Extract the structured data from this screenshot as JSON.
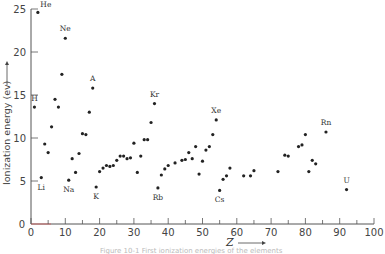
{
  "chart_data": {
    "type": "scatter",
    "title": "",
    "xlabel": "Z",
    "ylabel": "Ionization energy (ev)",
    "xlim": [
      0,
      100
    ],
    "ylim": [
      0,
      25
    ],
    "x_ticks": [
      0,
      10,
      20,
      30,
      40,
      50,
      60,
      70,
      80,
      90,
      100
    ],
    "y_ticks": [
      0,
      5,
      10,
      15,
      20,
      25
    ],
    "grid": false,
    "legend": null,
    "points": [
      {
        "z": 1,
        "ie": 13.6,
        "label": "H"
      },
      {
        "z": 2,
        "ie": 24.6,
        "label": "He"
      },
      {
        "z": 3,
        "ie": 5.4,
        "label": "Li"
      },
      {
        "z": 4,
        "ie": 9.3
      },
      {
        "z": 5,
        "ie": 8.3
      },
      {
        "z": 6,
        "ie": 11.3
      },
      {
        "z": 7,
        "ie": 14.5
      },
      {
        "z": 8,
        "ie": 13.6
      },
      {
        "z": 9,
        "ie": 17.4
      },
      {
        "z": 10,
        "ie": 21.6,
        "label": "Ne"
      },
      {
        "z": 11,
        "ie": 5.1,
        "label": "Na"
      },
      {
        "z": 12,
        "ie": 7.6
      },
      {
        "z": 13,
        "ie": 6.0
      },
      {
        "z": 14,
        "ie": 8.2
      },
      {
        "z": 15,
        "ie": 10.5
      },
      {
        "z": 16,
        "ie": 10.4
      },
      {
        "z": 17,
        "ie": 13.0
      },
      {
        "z": 18,
        "ie": 15.8,
        "label": "A"
      },
      {
        "z": 19,
        "ie": 4.3,
        "label": "K"
      },
      {
        "z": 20,
        "ie": 6.1
      },
      {
        "z": 21,
        "ie": 6.5
      },
      {
        "z": 22,
        "ie": 6.8
      },
      {
        "z": 23,
        "ie": 6.7
      },
      {
        "z": 24,
        "ie": 6.8
      },
      {
        "z": 25,
        "ie": 7.4
      },
      {
        "z": 26,
        "ie": 7.9
      },
      {
        "z": 27,
        "ie": 7.9
      },
      {
        "z": 28,
        "ie": 7.6
      },
      {
        "z": 29,
        "ie": 7.7
      },
      {
        "z": 30,
        "ie": 9.4
      },
      {
        "z": 31,
        "ie": 6.0
      },
      {
        "z": 32,
        "ie": 7.9
      },
      {
        "z": 33,
        "ie": 9.8
      },
      {
        "z": 34,
        "ie": 9.8
      },
      {
        "z": 35,
        "ie": 11.8
      },
      {
        "z": 36,
        "ie": 14.0,
        "label": "Kr"
      },
      {
        "z": 37,
        "ie": 4.2,
        "label": "Rb"
      },
      {
        "z": 38,
        "ie": 5.7
      },
      {
        "z": 39,
        "ie": 6.4
      },
      {
        "z": 40,
        "ie": 6.8
      },
      {
        "z": 42,
        "ie": 7.1
      },
      {
        "z": 44,
        "ie": 7.4
      },
      {
        "z": 45,
        "ie": 7.5
      },
      {
        "z": 46,
        "ie": 8.3
      },
      {
        "z": 47,
        "ie": 7.6
      },
      {
        "z": 48,
        "ie": 9.0
      },
      {
        "z": 49,
        "ie": 5.8
      },
      {
        "z": 50,
        "ie": 7.3
      },
      {
        "z": 51,
        "ie": 8.6
      },
      {
        "z": 52,
        "ie": 9.0
      },
      {
        "z": 53,
        "ie": 10.4
      },
      {
        "z": 54,
        "ie": 12.1,
        "label": "Xe"
      },
      {
        "z": 55,
        "ie": 3.9,
        "label": "Cs"
      },
      {
        "z": 56,
        "ie": 5.2
      },
      {
        "z": 57,
        "ie": 5.6
      },
      {
        "z": 58,
        "ie": 6.5
      },
      {
        "z": 62,
        "ie": 5.6
      },
      {
        "z": 64,
        "ie": 5.6
      },
      {
        "z": 65,
        "ie": 6.2
      },
      {
        "z": 72,
        "ie": 6.1
      },
      {
        "z": 74,
        "ie": 8.0
      },
      {
        "z": 75,
        "ie": 7.9
      },
      {
        "z": 78,
        "ie": 9.0
      },
      {
        "z": 79,
        "ie": 9.2
      },
      {
        "z": 80,
        "ie": 10.4
      },
      {
        "z": 81,
        "ie": 6.1
      },
      {
        "z": 82,
        "ie": 7.4
      },
      {
        "z": 83,
        "ie": 7.0
      },
      {
        "z": 86,
        "ie": 10.7,
        "label": "Rn"
      },
      {
        "z": 92,
        "ie": 4.0,
        "label": "U"
      }
    ],
    "annotations": [
      "He",
      "Ne",
      "A",
      "Kr",
      "Xe",
      "Rn",
      "H",
      "Li",
      "Na",
      "K",
      "Rb",
      "Cs",
      "U"
    ]
  },
  "caption": "Figure 10-1  First ionization energies of the elements"
}
